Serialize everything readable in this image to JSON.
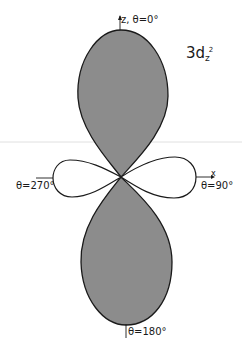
{
  "diagram": {
    "orbital_label": {
      "main": "3d",
      "subscript": "z",
      "superscript": "2"
    },
    "axes": {
      "z_axis_label": "z, θ=0°",
      "x_axis_label": "x",
      "right_angle_label": "θ=90°",
      "left_angle_label": "θ=270°",
      "bottom_angle_label": "θ=180°"
    },
    "colors": {
      "lobe_fill": "#8c8c8c",
      "outline": "#1a1a1a",
      "background": "#ffffff",
      "guide_line": "#d8d8d8"
    },
    "lobes": [
      {
        "name": "top-lobe",
        "shaded": true,
        "direction": "θ=0°"
      },
      {
        "name": "bottom-lobe",
        "shaded": true,
        "direction": "θ=180°"
      },
      {
        "name": "left-torus-lobe",
        "shaded": false,
        "direction": "θ=270°"
      },
      {
        "name": "right-torus-lobe",
        "shaded": false,
        "direction": "θ=90°"
      }
    ]
  }
}
